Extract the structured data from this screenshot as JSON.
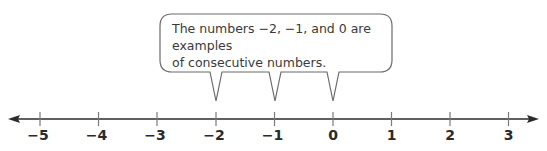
{
  "callout": {
    "line1": "The numbers −2, −1, and 0 are examples",
    "line2": "of consecutive numbers.",
    "points_to": [
      -2,
      -1,
      0
    ]
  },
  "number_line": {
    "min": -5,
    "max": 3,
    "ticks": [
      {
        "value": -5,
        "label": "−5"
      },
      {
        "value": -4,
        "label": "−4"
      },
      {
        "value": -3,
        "label": "−3"
      },
      {
        "value": -2,
        "label": "−2"
      },
      {
        "value": -1,
        "label": "−1"
      },
      {
        "value": 0,
        "label": "0"
      },
      {
        "value": 1,
        "label": "1"
      },
      {
        "value": 2,
        "label": "2"
      },
      {
        "value": 3,
        "label": "3"
      }
    ],
    "arrows": "both"
  },
  "colors": {
    "line": "#2b2b2b",
    "bubble_stroke": "#6b6b6b",
    "tick": "#7a7a7a",
    "text": "#3a3a3a"
  }
}
